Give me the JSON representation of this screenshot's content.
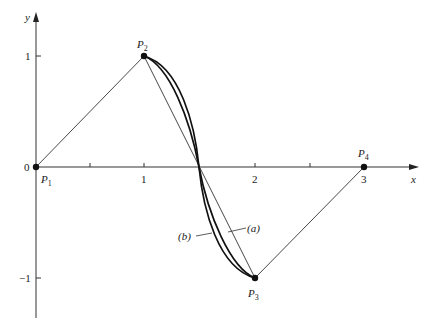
{
  "figure": {
    "type": "diagram",
    "axes": {
      "x_label": "x",
      "y_label": "y",
      "x_ticks": [
        {
          "value": 1,
          "label": "1"
        },
        {
          "value": 2,
          "label": "2"
        },
        {
          "value": 3,
          "label": "3"
        }
      ],
      "x_minor_ticks": [
        0.5,
        2.5
      ],
      "y_ticks": [
        {
          "value": 1,
          "label": "1"
        },
        {
          "value": 0,
          "label": "0"
        },
        {
          "value": -1,
          "label": "−1"
        }
      ]
    },
    "points": [
      {
        "name": "P",
        "sub": "1",
        "x": 0,
        "y": 0
      },
      {
        "name": "P",
        "sub": "2",
        "x": 1,
        "y": 1
      },
      {
        "name": "P",
        "sub": "3",
        "x": 2,
        "y": -1
      },
      {
        "name": "P",
        "sub": "4",
        "x": 3,
        "y": 0
      }
    ],
    "curve_labels": {
      "a": "(a)",
      "b": "(b)"
    },
    "colors": {
      "line": "#1a1a1a",
      "background": "#ffffff"
    }
  }
}
